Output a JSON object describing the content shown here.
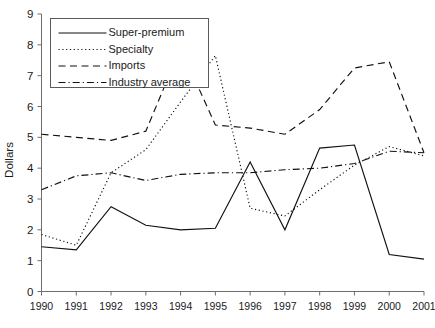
{
  "chart_data": {
    "type": "line",
    "title": "",
    "xlabel": "",
    "ylabel": "Dollars",
    "categories": [
      "1990",
      "1991",
      "1992",
      "1993",
      "1994",
      "1995",
      "1996",
      "1997",
      "1998",
      "1999",
      "2000",
      "2001"
    ],
    "x": [
      1990,
      1991,
      1992,
      1993,
      1994,
      1995,
      1996,
      1997,
      1998,
      1999,
      2000,
      2001
    ],
    "ylim": [
      0,
      9
    ],
    "xlim": [
      1990,
      2001
    ],
    "yticks": [
      0,
      1,
      2,
      3,
      4,
      5,
      6,
      7,
      8,
      9
    ],
    "ytick_labels": [
      "0",
      "1",
      "2",
      "3",
      "4",
      "5",
      "6",
      "7",
      "8",
      "9"
    ],
    "grid": false,
    "legend_position": "top-left",
    "series": [
      {
        "name": "Super-premium",
        "style": "solid",
        "values": [
          1.45,
          1.35,
          2.75,
          2.15,
          2.0,
          2.05,
          4.2,
          2.0,
          4.65,
          4.75,
          1.2,
          1.05
        ]
      },
      {
        "name": "Specialty",
        "style": "dotted",
        "values": [
          1.85,
          1.5,
          3.85,
          4.6,
          6.15,
          7.65,
          2.7,
          2.45,
          3.3,
          4.1,
          4.7,
          4.4
        ]
      },
      {
        "name": "Imports",
        "style": "dashed",
        "values": [
          5.1,
          5.0,
          4.9,
          5.2,
          7.9,
          5.4,
          5.3,
          5.1,
          5.9,
          7.25,
          7.45,
          4.5
        ]
      },
      {
        "name": "Industry average",
        "style": "dashdot",
        "values": [
          3.3,
          3.75,
          3.85,
          3.6,
          3.8,
          3.85,
          3.85,
          3.95,
          4.0,
          4.15,
          4.55,
          4.5
        ]
      }
    ]
  },
  "legend": {
    "items": [
      {
        "label": "Super-premium",
        "style": "solid"
      },
      {
        "label": "Specialty",
        "style": "dotted"
      },
      {
        "label": "Imports",
        "style": "dashed"
      },
      {
        "label": "Industry average",
        "style": "dashdot"
      }
    ]
  },
  "axes": {
    "y_title": "Dollars",
    "y_labels": [
      "9",
      "8",
      "7",
      "6",
      "5",
      "4",
      "3",
      "2",
      "1",
      "0"
    ],
    "x_labels": [
      "1990",
      "1991",
      "1992",
      "1993",
      "1994",
      "1995",
      "1996",
      "1997",
      "1998",
      "1999",
      "2000",
      "2001"
    ]
  }
}
